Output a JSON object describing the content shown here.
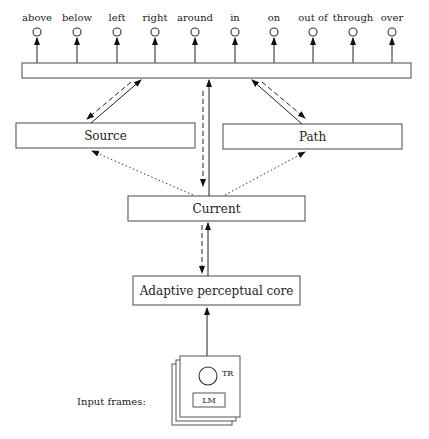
{
  "diagram": {
    "output_units": [
      {
        "label": "above",
        "x": 37
      },
      {
        "label": "below",
        "x": 77
      },
      {
        "label": "left",
        "x": 117
      },
      {
        "label": "right",
        "x": 155
      },
      {
        "label": "around",
        "x": 195
      },
      {
        "label": "in",
        "x": 235
      },
      {
        "label": "on",
        "x": 274
      },
      {
        "label": "out of",
        "x": 313
      },
      {
        "label": "through",
        "x": 353
      },
      {
        "label": "over",
        "x": 392
      }
    ],
    "boxes": {
      "source": "Source",
      "path": "Path",
      "current": "Current",
      "core": "Adaptive perceptual core"
    },
    "input": {
      "label": "Input frames:",
      "trajector": "TR",
      "landmark": "LM"
    }
  }
}
